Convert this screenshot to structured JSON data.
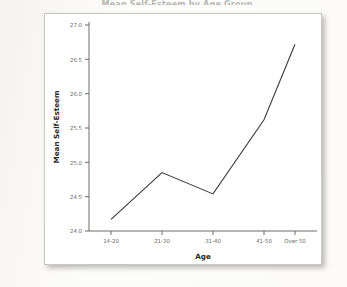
{
  "page": {
    "title_sliver": "Mean Self-Esteem by Age Group",
    "background_color": "#fdfdfc"
  },
  "chart_panel": {
    "border_color": "#c8c7c5",
    "background_color": "#ffffff"
  },
  "chart_data": {
    "type": "line",
    "title": "",
    "xlabel": "Age",
    "ylabel": "Mean Self-Esteem",
    "categories": [
      "14-20",
      "21-30",
      "31-40",
      "41-50",
      "Over 50"
    ],
    "values": [
      24.17,
      24.85,
      24.54,
      25.62,
      26.72
    ],
    "ylim": [
      23.85,
      27.15
    ],
    "yticks": [
      "24.0",
      "24.5",
      "25.0",
      "25.5",
      "26.0",
      "26.5",
      "27.0"
    ],
    "ytick_values": [
      24.0,
      24.5,
      25.0,
      25.5,
      26.0,
      26.5,
      27.0
    ],
    "grid": false,
    "legend": "none",
    "line_color": "#3c3a38",
    "markers": "none"
  }
}
